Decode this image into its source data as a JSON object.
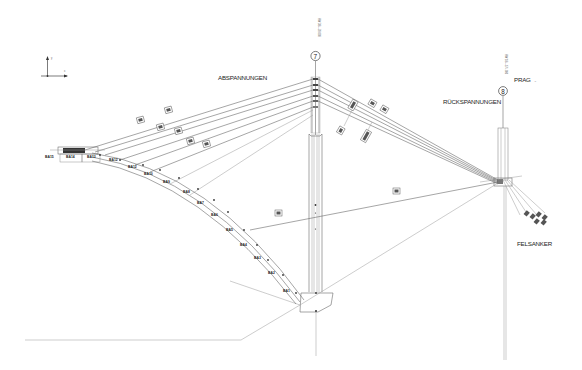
{
  "drawing": {
    "type": "cable-stayed bridge stay-cable elevation",
    "labels": {
      "abspannungen": "ABSPANNUNGEN",
      "rueckspannungen": "RÜCKSPANNUNGEN",
      "felsanker": "FELSANKER",
      "prag": "PRAG",
      "prag_suffix": "→"
    },
    "axes": {
      "y": "y",
      "x": "x"
    },
    "pylons": [
      {
        "id": "7",
        "label": "7",
        "vertical_text": "HW 384+20.000"
      },
      {
        "id": "8",
        "label": "8",
        "vertical_text": "HW 184+174.000"
      }
    ],
    "segments": [
      "BA15",
      "BA14",
      "BA13",
      "BA12",
      "BA11",
      "BA10",
      "BA9",
      "BA8",
      "BA7",
      "BA6",
      "BA5",
      "BA4",
      "BA3",
      "BA2",
      "BA1"
    ]
  }
}
